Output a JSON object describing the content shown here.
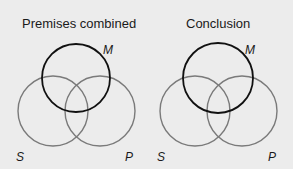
{
  "figure": {
    "background": "#ececec",
    "colors": {
      "middle_term_stroke": "#111111",
      "subject_predicate_stroke": "#7a7a7a",
      "text": "#1a1a1a"
    },
    "diagrams": [
      {
        "title": "Premises combined",
        "circles": {
          "M": {
            "label": "M",
            "cx": 76,
            "cy": 78,
            "r": 34
          },
          "S": {
            "label": "S",
            "cx": 53,
            "cy": 111,
            "r": 35
          },
          "P": {
            "label": "P",
            "cx": 100,
            "cy": 111,
            "r": 35
          }
        }
      },
      {
        "title": "Conclusion",
        "circles": {
          "M": {
            "label": "M",
            "cx": 218,
            "cy": 78,
            "r": 35
          },
          "S": {
            "label": "S",
            "cx": 195,
            "cy": 111,
            "r": 35
          },
          "P": {
            "label": "P",
            "cx": 242,
            "cy": 111,
            "r": 35
          }
        }
      }
    ]
  }
}
